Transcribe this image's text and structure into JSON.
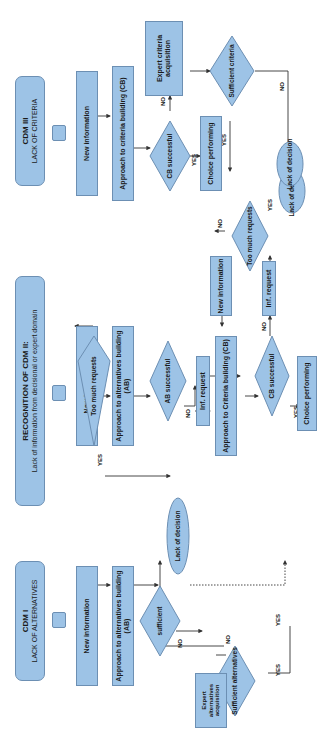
{
  "colors": {
    "node_fill": "#9dc3e6",
    "node_border": "#6c8fb3",
    "line": "#333333"
  },
  "cdm1": {
    "title": "CDM I",
    "subtitle": "LACK OF ALTERNATIVES",
    "new_information": "New information",
    "approach": "Approach to alternatives building (AB)",
    "sufficient": "sufficient",
    "expert": "Expert alternatives acquisition",
    "sufficient_alternatives": "Sufficient alternatives",
    "lack_of_decision": "Lack of decision",
    "labels": {
      "no1": "NO",
      "no2": "NO",
      "yes1": "YES",
      "yes2": "YES"
    }
  },
  "cdm2": {
    "title": "RECOGNITION OF CDM II:",
    "subtitle": "Lack of information from decisional or expert domain",
    "new_information": "New information",
    "approach_ab": "Approach to alternatives building (AB)",
    "ab_successful": "AB successful",
    "inf_request_1": "Inf. request",
    "too_much_requests_1": "Too much requests",
    "approach_cb": "Approach to Criteria building (CB)",
    "new_information_2": "New information",
    "cb_successful": "CB successful",
    "inf_request_2": "Inf. request",
    "too_much_requests_2": "Too much requests",
    "choice_performing": "Choice performing",
    "lack_of_decision": "Lack of decision",
    "labels": {
      "no_ab": "NO",
      "yes_ab": "YES",
      "no_tmr1": "NO",
      "yes_tmr1": "YES",
      "no_cb": "NO",
      "yes_cb": "YES",
      "no_tmr2": "NO",
      "yes_tmr2": "YES"
    }
  },
  "cdm3": {
    "title": "CDM III",
    "subtitle": "LACK OF CRITERIA",
    "new_information": "New information",
    "approach": "Approach to criteria building (CB)",
    "cb_successful": "CB successful",
    "expert": "Expert criteria acquisition",
    "sufficient_criteria": "Sufficient criteria",
    "choice_performing": "Choice performing",
    "lack_of_decision": "Lack of decision",
    "labels": {
      "no1": "NO",
      "yes1": "YES",
      "yes2": "YES",
      "no2": "NO"
    }
  }
}
